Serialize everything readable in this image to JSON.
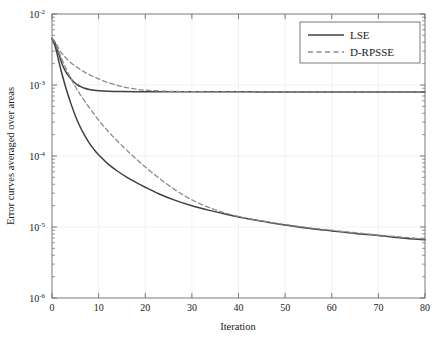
{
  "chart_data": {
    "type": "line",
    "title": "",
    "xlabel": "Iteration",
    "ylabel": "Error curves averaged over areas",
    "xlim": [
      0,
      80
    ],
    "ylim": [
      1e-06,
      0.01
    ],
    "yscale": "log",
    "xscale": "linear",
    "grid": "faint major gridlines, x and y",
    "legend_position": "top-right inside axes",
    "xticks": [
      "0",
      "10",
      "20",
      "30",
      "40",
      "50",
      "60",
      "70",
      "80"
    ],
    "xtick_values": [
      0,
      10,
      20,
      30,
      40,
      50,
      60,
      70,
      80
    ],
    "ytick_labels": [
      "10^-2",
      "10^-3",
      "10^-4",
      "10^-5",
      "10^-6"
    ],
    "ytick_bases": [
      "10",
      "10",
      "10",
      "10",
      "10"
    ],
    "ytick_exponents": [
      "-2",
      "-3",
      "-4",
      "-5",
      "-6"
    ],
    "ytick_values": [
      0.01,
      0.001,
      0.0001,
      1e-05,
      1e-06
    ],
    "series": [
      {
        "name": "LSE",
        "style": "solid",
        "color": "#404040",
        "comment": "upper solid curve, plateaus near 8e-4",
        "x": [
          0,
          0.5,
          1,
          1.5,
          2,
          2.5,
          3,
          3.5,
          4,
          4.5,
          5,
          5.5,
          6,
          7,
          8,
          9,
          10,
          12,
          15,
          20,
          25,
          30,
          35,
          40,
          45,
          50,
          55,
          60,
          65,
          70,
          75,
          80
        ],
        "y": [
          0.0045,
          0.0041,
          0.0034,
          0.0027,
          0.0021,
          0.00175,
          0.00152,
          0.00136,
          0.00124,
          0.00114,
          0.00106,
          0.001,
          0.00096,
          0.0009,
          0.000865,
          0.000845,
          0.000832,
          0.000818,
          0.00081,
          0.000805,
          0.000803,
          0.000802,
          0.000801,
          0.000801,
          0.0008,
          0.0008,
          0.0008,
          0.0008,
          0.0008,
          0.0008,
          0.0008,
          0.0008
        ]
      },
      {
        "name": "D-RPSSE",
        "style": "dashed",
        "color": "#808080",
        "comment": "upper dashed curve, joins plateau near 8e-4 by iter 20",
        "x": [
          0,
          0.5,
          1,
          1.5,
          2,
          2.5,
          3,
          4,
          5,
          6,
          7,
          8,
          9,
          10,
          12,
          14,
          16,
          18,
          20,
          25,
          30,
          40,
          50,
          60,
          70,
          80
        ],
        "y": [
          0.0045,
          0.0042,
          0.0037,
          0.0032,
          0.00285,
          0.0026,
          0.0024,
          0.00208,
          0.00185,
          0.00167,
          0.00152,
          0.0014,
          0.0013,
          0.00122,
          0.00108,
          0.00099,
          0.00092,
          0.000875,
          0.000845,
          0.000815,
          0.000805,
          0.0008,
          0.0008,
          0.0008,
          0.0008,
          0.0008
        ]
      },
      {
        "name": "LSE",
        "style": "solid",
        "color": "#404040",
        "comment": "lower solid curve, descends to ~6.5e-6",
        "x": [
          0,
          0.5,
          1,
          1.5,
          2,
          3,
          4,
          5,
          6,
          7,
          8,
          9,
          10,
          12,
          14,
          16,
          18,
          20,
          23,
          26,
          30,
          34,
          38,
          42,
          46,
          50,
          55,
          60,
          65,
          70,
          75,
          80
        ],
        "y": [
          0.0045,
          0.0038,
          0.0029,
          0.0021,
          0.00155,
          0.0009,
          0.00056,
          0.00037,
          0.00026,
          0.000195,
          0.000152,
          0.000124,
          0.000104,
          7.75e-05,
          6.15e-05,
          5.05e-05,
          4.25e-05,
          3.63e-05,
          2.92e-05,
          2.43e-05,
          1.99e-05,
          1.7e-05,
          1.48e-05,
          1.31e-05,
          1.18e-05,
          1.07e-05,
          9.6e-06,
          8.8e-06,
          8.1e-06,
          7.6e-06,
          7e-06,
          6.6e-06
        ]
      },
      {
        "name": "D-RPSSE",
        "style": "dashed",
        "color": "#808080",
        "comment": "lower dashed curve, merges with lower solid near iter 42",
        "x": [
          0,
          0.5,
          1,
          1.5,
          2,
          3,
          4,
          5,
          6,
          8,
          10,
          12,
          14,
          16,
          18,
          20,
          23,
          26,
          29,
          32,
          35,
          38,
          41,
          44,
          48,
          52,
          56,
          60,
          65,
          70,
          75,
          80
        ],
        "y": [
          0.0045,
          0.0041,
          0.0035,
          0.0029,
          0.0024,
          0.0017,
          0.00125,
          0.00095,
          0.00074,
          0.00048,
          0.00032,
          0.000225,
          0.000163,
          0.000121,
          9.15e-05,
          7e-05,
          4.85e-05,
          3.48e-05,
          2.62e-05,
          2.09e-05,
          1.75e-05,
          1.52e-05,
          1.36e-05,
          1.25e-05,
          1.13e-05,
          1.04e-05,
          9.6e-06,
          9e-06,
          8.3e-06,
          7.7e-06,
          7.2e-06,
          6.8e-06
        ]
      }
    ],
    "legend_entries": [
      {
        "label": "LSE",
        "style": "solid"
      },
      {
        "label": "D-RPSSE",
        "style": "dashed"
      }
    ],
    "colors": {
      "solid_line": "#404040",
      "dashed_line": "#8a8a8a",
      "axis": "#6b6b6b",
      "grid": "#eeeeee",
      "text": "#1a1a1a",
      "background": "#ffffff"
    }
  }
}
